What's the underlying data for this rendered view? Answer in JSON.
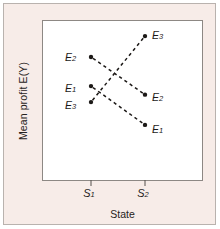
{
  "figure": {
    "panel_bg": "#f7ece8",
    "plot_bg": "#ffffff",
    "frame_color": "#8d8884",
    "ink_color": "#1c1917"
  },
  "chart_data": {
    "type": "line",
    "title": "",
    "subtitle": "",
    "xlabel": "State",
    "ylabel": "Mean profit E(Y)",
    "grid": false,
    "legend": false,
    "legend_position": "none",
    "annotation_style": "endpoint-labels",
    "line_style": "dashed",
    "marker": "filled-circle",
    "x": [
      "S1",
      "S2"
    ],
    "xtick_labels": [
      "S",
      "S"
    ],
    "xtick_subscripts": [
      "1",
      "2"
    ],
    "xlim": [
      "S1",
      "S2"
    ],
    "ylim": [
      0,
      1
    ],
    "series": [
      {
        "name": "E1",
        "label_base": "E",
        "label_sub": "1",
        "values": [
          0.565,
          0.31
        ],
        "start_label_side": "left",
        "end_label_side": "right"
      },
      {
        "name": "E2",
        "label_base": "E",
        "label_sub": "2",
        "values": [
          0.757,
          0.509
        ],
        "start_label_side": "left",
        "end_label_side": "right"
      },
      {
        "name": "E3",
        "label_base": "E",
        "label_sub": "3",
        "values": [
          0.46,
          0.894
        ],
        "start_label_side": "left",
        "end_label_side": "right"
      }
    ],
    "point_labels": [
      {
        "text": "E",
        "sub": "2",
        "at": "S1",
        "series": "E2"
      },
      {
        "text": "E",
        "sub": "1",
        "at": "S1",
        "series": "E1"
      },
      {
        "text": "E",
        "sub": "3",
        "at": "S1",
        "series": "E3"
      },
      {
        "text": "E",
        "sub": "3",
        "at": "S2",
        "series": "E3"
      },
      {
        "text": "E",
        "sub": "2",
        "at": "S2",
        "series": "E2"
      },
      {
        "text": "E",
        "sub": "1",
        "at": "S2",
        "series": "E1"
      }
    ]
  },
  "axis": {
    "x_title": "State",
    "y_title": "Mean profit E(Y)",
    "tick1_base": "S",
    "tick1_sub": "1",
    "tick2_base": "S",
    "tick2_sub": "2"
  },
  "labels": {
    "e1_base": "E",
    "e1_sub": "1",
    "e2_base": "E",
    "e2_sub": "2",
    "e3_base": "E",
    "e3_sub": "3"
  }
}
